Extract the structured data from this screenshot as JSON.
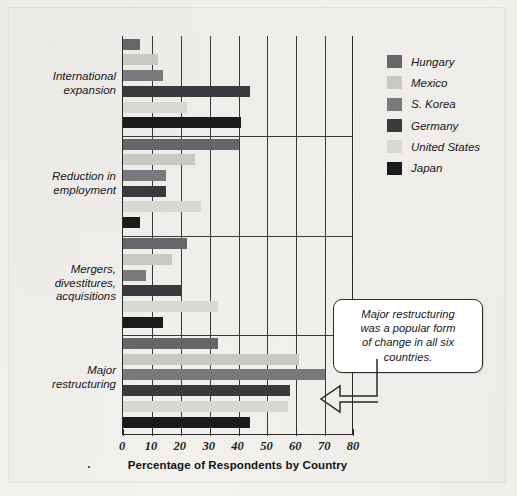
{
  "chart_data": {
    "type": "bar",
    "orientation": "horizontal",
    "title": "",
    "xlabel": "Percentage of Respondents by Country",
    "ylabel": "",
    "xlim": [
      0,
      80
    ],
    "xticks": [
      0,
      10,
      20,
      30,
      40,
      50,
      60,
      70,
      80
    ],
    "grid": "vertical gridlines at every x tick",
    "legend_position": "right",
    "categories": [
      "International expansion",
      "Reduction in employment",
      "Mergers, divestitures, acquisitions",
      "Major restructuring"
    ],
    "series": [
      {
        "name": "Hungary",
        "color": "#66666a",
        "values": [
          6,
          40,
          22,
          33
        ]
      },
      {
        "name": "Mexico",
        "color": "#c9c9c4",
        "values": [
          12,
          25,
          17,
          61
        ]
      },
      {
        "name": "S. Korea",
        "color": "#79797c",
        "values": [
          14,
          15,
          8,
          70
        ]
      },
      {
        "name": "Germany",
        "color": "#3a3a3e",
        "values": [
          44,
          15,
          20,
          58
        ]
      },
      {
        "name": "United States",
        "color": "#d9d9d4",
        "values": [
          22,
          27,
          33,
          57
        ]
      },
      {
        "name": "Japan",
        "color": "#1b1b1d",
        "values": [
          41,
          6,
          14,
          44
        ]
      }
    ],
    "annotations": [
      {
        "text": "Major restructuring was a popular form of change in all six countries.",
        "lines": [
          "Major restructuring",
          "was a popular form",
          "of change in all six",
          "countries."
        ],
        "points_to": "Major restructuring / S. Korea bar"
      }
    ]
  },
  "axis": {
    "x_title": "Percentage of Respondents by Country",
    "x_tick_labels": [
      "0",
      "10",
      "20",
      "30",
      "40",
      "50",
      "60",
      "70",
      "80"
    ],
    "category_labels": [
      [
        "International",
        "expansion"
      ],
      [
        "Reduction in",
        "employment"
      ],
      [
        "Mergers,",
        "divestitures,",
        "acquisitions"
      ],
      [
        "Major",
        "restructuring"
      ]
    ]
  },
  "legend": {
    "items": [
      {
        "label": "Hungary",
        "color": "#66666a"
      },
      {
        "label": "Mexico",
        "color": "#c9c9c4"
      },
      {
        "label": "S. Korea",
        "color": "#79797c"
      },
      {
        "label": "Germany",
        "color": "#3a3a3e"
      },
      {
        "label": "United States",
        "color": "#d9d9d4"
      },
      {
        "label": "Japan",
        "color": "#1b1b1d"
      }
    ]
  },
  "callout": {
    "line1": "Major restructuring",
    "line2": "was a popular form",
    "line3": "of change in all six",
    "line4": "countries."
  }
}
